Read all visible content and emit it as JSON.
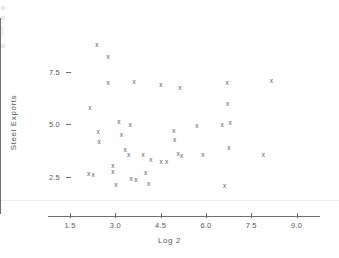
{
  "chart_data": {
    "type": "scatter",
    "title": "",
    "xlabel": "Log 2",
    "ylabel": "Steel Exports",
    "marker": "x",
    "grid": false,
    "legend": null,
    "xlim": [
      1.0,
      9.9
    ],
    "ylim": [
      1.6,
      9.2
    ],
    "xticks": [
      "1.5",
      "3.0",
      "4.5",
      "6.0",
      "7.5",
      "9.0"
    ],
    "xtick_values": [
      1.5,
      3.0,
      4.5,
      6.0,
      7.5,
      9.0
    ],
    "yticks": [
      "2.5",
      "5.0",
      "7.5"
    ],
    "ytick_values": [
      2.5,
      5.0,
      7.5
    ],
    "points": [
      {
        "x": 2.39,
        "y": 8.85
      },
      {
        "x": 2.76,
        "y": 8.23
      },
      {
        "x": 2.76,
        "y": 7.03
      },
      {
        "x": 3.62,
        "y": 7.05
      },
      {
        "x": 4.51,
        "y": 6.9
      },
      {
        "x": 5.14,
        "y": 6.78
      },
      {
        "x": 6.7,
        "y": 7.02
      },
      {
        "x": 8.17,
        "y": 7.09
      },
      {
        "x": 2.16,
        "y": 5.83
      },
      {
        "x": 6.72,
        "y": 6.0
      },
      {
        "x": 3.12,
        "y": 5.13
      },
      {
        "x": 3.49,
        "y": 5.02
      },
      {
        "x": 6.54,
        "y": 5.0
      },
      {
        "x": 6.8,
        "y": 5.1
      },
      {
        "x": 5.7,
        "y": 4.95
      },
      {
        "x": 2.43,
        "y": 4.65
      },
      {
        "x": 3.2,
        "y": 4.52
      },
      {
        "x": 4.94,
        "y": 4.72
      },
      {
        "x": 2.46,
        "y": 4.2
      },
      {
        "x": 4.96,
        "y": 4.27
      },
      {
        "x": 3.32,
        "y": 3.82
      },
      {
        "x": 6.76,
        "y": 3.9
      },
      {
        "x": 3.44,
        "y": 3.55
      },
      {
        "x": 3.92,
        "y": 3.58
      },
      {
        "x": 5.08,
        "y": 3.62
      },
      {
        "x": 5.2,
        "y": 3.54
      },
      {
        "x": 5.9,
        "y": 3.57
      },
      {
        "x": 7.9,
        "y": 3.58
      },
      {
        "x": 4.18,
        "y": 3.33
      },
      {
        "x": 4.52,
        "y": 3.21
      },
      {
        "x": 4.7,
        "y": 3.21
      },
      {
        "x": 2.92,
        "y": 3.05
      },
      {
        "x": 2.92,
        "y": 2.73
      },
      {
        "x": 2.12,
        "y": 2.66
      },
      {
        "x": 2.26,
        "y": 2.61
      },
      {
        "x": 4.0,
        "y": 2.7
      },
      {
        "x": 3.52,
        "y": 2.42
      },
      {
        "x": 3.68,
        "y": 2.35
      },
      {
        "x": 3.02,
        "y": 2.12
      },
      {
        "x": 4.1,
        "y": 2.17
      },
      {
        "x": 6.62,
        "y": 2.08
      }
    ]
  },
  "axes": {
    "x_label": "Log  2",
    "y_label": "Steel Exports"
  }
}
